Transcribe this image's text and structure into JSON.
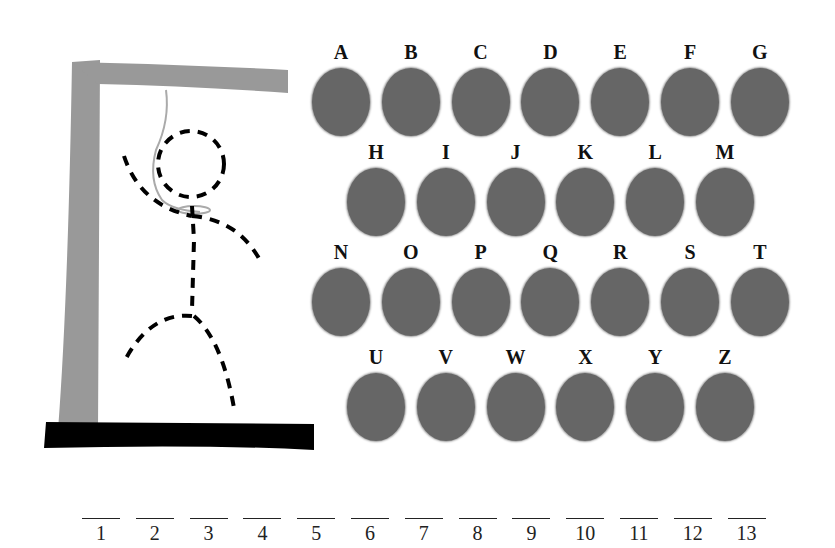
{
  "game": {
    "title": "Hangman",
    "colors": {
      "gallows": "#999999",
      "base": "#000000",
      "letter_button": "#666666",
      "figure": "#000000",
      "rope": "#aaaaaa"
    }
  },
  "letters": {
    "rows": [
      [
        "A",
        "B",
        "C",
        "D",
        "E",
        "F",
        "G"
      ],
      [
        "H",
        "I",
        "J",
        "K",
        "L",
        "M"
      ],
      [
        "N",
        "O",
        "P",
        "Q",
        "R",
        "S",
        "T"
      ],
      [
        "U",
        "V",
        "W",
        "X",
        "Y",
        "Z"
      ]
    ]
  },
  "slots": [
    "1",
    "2",
    "3",
    "4",
    "5",
    "6",
    "7",
    "8",
    "9",
    "10",
    "11",
    "12",
    "13"
  ]
}
